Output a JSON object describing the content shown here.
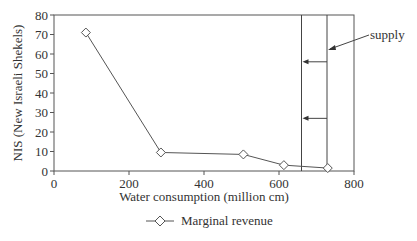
{
  "chart_data": {
    "type": "line",
    "title": "",
    "xlabel": "Water consumption (million cm)",
    "ylabel": "NIS (New Israeli Shekels)",
    "xlim": [
      0,
      800
    ],
    "ylim": [
      0,
      80
    ],
    "x_ticks": [
      "0",
      "200",
      "400",
      "600",
      "800"
    ],
    "y_ticks": [
      "0",
      "10",
      "20",
      "30",
      "40",
      "50",
      "60",
      "70",
      "80"
    ],
    "grid": false,
    "legend_position": "bottom",
    "series": [
      {
        "name": "Marginal revenue",
        "marker": "diamond",
        "x": [
          85,
          285,
          505,
          613,
          730
        ],
        "y": [
          71,
          9.5,
          8.5,
          3,
          1.5
        ]
      }
    ],
    "annotations": [
      {
        "type": "vertical-line",
        "label": "supply",
        "x": 660
      },
      {
        "type": "vertical-line",
        "label": "supply",
        "x": 728
      },
      {
        "type": "arrow",
        "from_x": 728,
        "to_x": 660,
        "y": 56
      },
      {
        "type": "arrow",
        "from_x": 728,
        "to_x": 660,
        "y": 27
      },
      {
        "type": "text-arrow",
        "text": "supply",
        "points_to_x": 728,
        "y": 68
      }
    ]
  },
  "legend": {
    "items": [
      {
        "label": "Marginal revenue"
      }
    ]
  },
  "labels": {
    "supply": "supply"
  }
}
